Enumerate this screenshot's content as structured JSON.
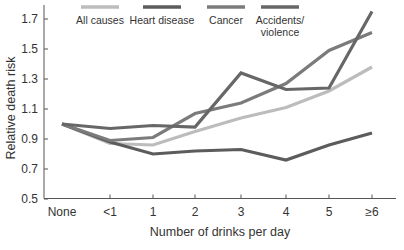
{
  "chart_data": {
    "type": "line",
    "title": "",
    "xlabel": "Number of drinks per day",
    "ylabel": "Relative death risk",
    "categories": [
      "None",
      "<1",
      "1",
      "2",
      "3",
      "4",
      "5",
      "≥6"
    ],
    "ylim": [
      0.5,
      1.8
    ],
    "yticks": [
      0.5,
      0.7,
      0.9,
      1.1,
      1.3,
      1.5,
      1.7
    ],
    "ytick_labels": [
      "0.5",
      "0.7",
      "0.9",
      "1.1",
      "1.3",
      "1.5",
      "1.7"
    ],
    "grid": false,
    "legend_position": "top",
    "series": [
      {
        "name": "All causes",
        "color": "#bcbcbc",
        "values": [
          1.0,
          0.87,
          0.86,
          0.95,
          1.04,
          1.11,
          1.22,
          1.38
        ]
      },
      {
        "name": "Heart disease",
        "color": "#5c5c5c",
        "values": [
          1.0,
          0.88,
          0.8,
          0.82,
          0.83,
          0.76,
          0.86,
          0.94
        ]
      },
      {
        "name": "Cancer",
        "color": "#7b7b7b",
        "values": [
          1.0,
          0.89,
          0.91,
          1.07,
          1.14,
          1.27,
          1.49,
          1.61
        ]
      },
      {
        "name": "Accidents/ violence",
        "label_lines": [
          "Accidents/",
          "violence"
        ],
        "color": "#676767",
        "values": [
          1.0,
          0.97,
          0.99,
          0.98,
          1.34,
          1.23,
          1.24,
          1.75
        ]
      }
    ]
  }
}
